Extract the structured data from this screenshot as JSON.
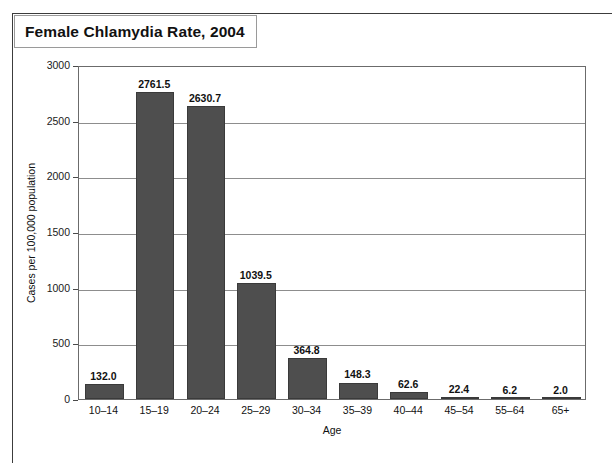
{
  "figure": {
    "title": "Female Chlamydia Rate, 2004"
  },
  "chart_data": {
    "type": "bar",
    "title": "Female Chlamydia Rate, 2004",
    "xlabel": "Age",
    "ylabel": "Cases per 100,000 population",
    "categories": [
      "10–14",
      "15–19",
      "20–24",
      "25–29",
      "30–34",
      "35–39",
      "40–44",
      "45–54",
      "55–64",
      "65+"
    ],
    "values": [
      132.0,
      2761.5,
      2630.7,
      1039.5,
      364.8,
      148.3,
      62.6,
      22.4,
      6.2,
      2.0
    ],
    "value_labels": [
      "132.0",
      "2761.5",
      "2630.7",
      "1039.5",
      "364.8",
      "148.3",
      "62.6",
      "22.4",
      "6.2",
      "2.0"
    ],
    "ylim": [
      0,
      3000
    ],
    "yticks": [
      0,
      500,
      1000,
      1500,
      2000,
      2500,
      3000
    ],
    "ytick_labels": [
      "0",
      "500",
      "1000",
      "1500",
      "2000",
      "2500",
      "3000"
    ],
    "grid": true,
    "legend": null,
    "bar_color": "#4e4e4e",
    "plot_border_color": "#6b6b6b",
    "gridline_color": "#8d8d8d"
  }
}
